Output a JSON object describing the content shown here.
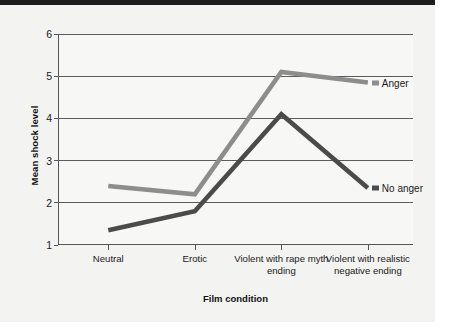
{
  "chart_data": {
    "type": "line",
    "title": "",
    "xlabel": "Film condition",
    "ylabel": "Mean shock level",
    "categories": [
      "Neutral",
      "Erotic",
      "Violent with rape myth ending",
      "Violent with realistic negative ending"
    ],
    "series": [
      {
        "name": "Anger",
        "values": [
          2.4,
          2.2,
          5.1,
          4.85
        ],
        "color": "#8d8d8d"
      },
      {
        "name": "No anger",
        "values": [
          1.35,
          1.8,
          4.1,
          2.35
        ],
        "color": "#4b4b4b"
      }
    ],
    "ylim": [
      1,
      6
    ],
    "yticks": [
      1,
      2,
      3,
      4,
      5,
      6
    ],
    "ytick_labels": [
      "1",
      "2",
      "3",
      "4",
      "5",
      "6"
    ],
    "grid": "horizontal",
    "legend_position": "inline-right"
  },
  "axes": {
    "y_title": "Mean shock level",
    "x_title": "Film condition",
    "y_tick_0": "1",
    "y_tick_1": "2",
    "y_tick_2": "3",
    "y_tick_3": "4",
    "y_tick_4": "5",
    "y_tick_5": "6",
    "x_tick_0": "Neutral",
    "x_tick_1": "Erotic",
    "x_tick_2": "Violent with rape myth ending",
    "x_tick_3": "Violent with realistic negative ending"
  },
  "legend": {
    "anger_label": "Anger",
    "no_anger_label": "No anger"
  },
  "colors": {
    "anger": "#8d8d8d",
    "no_anger": "#4b4b4b",
    "axis": "#55555a",
    "background": "#f3f3f1",
    "plot_background": "#f7f7f6"
  }
}
